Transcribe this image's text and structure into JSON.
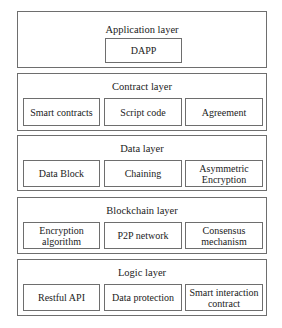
{
  "diagram": {
    "type": "layered-architecture",
    "layers": [
      {
        "title": "Application layer",
        "components": [
          "DAPP"
        ]
      },
      {
        "title": "Contract layer",
        "components": [
          "Smart contracts",
          "Script code",
          "Agreement"
        ]
      },
      {
        "title": "Data layer",
        "components": [
          "Data Block",
          "Chaining",
          "Asymmetric Encryption"
        ]
      },
      {
        "title": "Blockchain layer",
        "components": [
          "Encryption algorithm",
          "P2P network",
          "Consensus mechanism"
        ]
      },
      {
        "title": "Logic layer",
        "components": [
          "Restful API",
          "Data protection",
          "Smart interaction contract"
        ]
      }
    ]
  },
  "colors": {
    "border": "#6e6e6e",
    "text": "#222222",
    "background": "#ffffff"
  }
}
